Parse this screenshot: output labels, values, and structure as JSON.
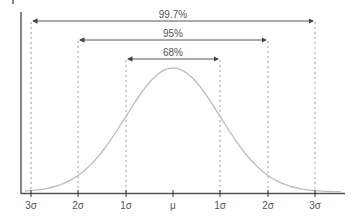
{
  "chart_data": {
    "type": "line",
    "xlabel": "",
    "ylabel": "",
    "x_tick_labels": [
      "3σ",
      "2σ",
      "1σ",
      "μ",
      "1σ",
      "2σ",
      "3σ"
    ],
    "x": [
      -3,
      -2,
      -1,
      0,
      1,
      2,
      3
    ],
    "curve": "normal density (bell curve)",
    "intervals": [
      {
        "label": "99.7%",
        "from": -3,
        "to": 3
      },
      {
        "label": "95%",
        "from": -2,
        "to": 2
      },
      {
        "label": "68%",
        "from": -1,
        "to": 1
      }
    ],
    "grid": false,
    "legend": "none"
  },
  "colors": {
    "axis": "#333333",
    "curve": "#bbbbbb",
    "arrows": "#444444",
    "dashed": "#888888",
    "text": "#555555"
  }
}
